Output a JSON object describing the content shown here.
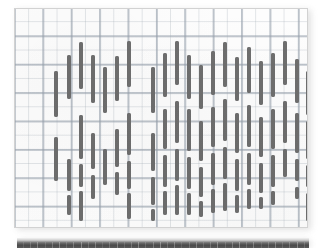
{
  "figure": {
    "kind": "scanned-graph-paper-figure",
    "panel": {
      "background_color": "#fdfdfd",
      "border_color": "#d2d2d2",
      "grid_minor_color": "#a0aab4",
      "grid_major_color": "#96a0ac",
      "grid_minor_spacing_px": 14.2,
      "grid_major_spacing_px": 28.4
    },
    "segment_color": "#6e6e6e",
    "segment_width_px": 3.4,
    "next_figure_strip": {
      "label": "cropped-top-edge-of-following-figure",
      "color_dark": "#4a4a4a",
      "color_light": "#f2f2f2"
    }
  },
  "chart_data": {
    "type": "bar",
    "title": "",
    "subtitle": "",
    "xlabel": "",
    "ylabel": "",
    "grid": true,
    "legend": null,
    "annotations": [],
    "xlim": [
      0,
      294
    ],
    "ylim": [
      0,
      220
    ],
    "note": "Vertical rounded bar segments plotted on graph paper; each column holds one or more stacked segments defined by top (y0) and bottom (y1) in panel pixel coordinates.",
    "columns": [
      {
        "x": 41,
        "segments": [
          {
            "y0": 62,
            "y1": 108
          },
          {
            "y0": 128,
            "y1": 172
          }
        ]
      },
      {
        "x": 54,
        "segments": [
          {
            "y0": 46,
            "y1": 90
          },
          {
            "y0": 150,
            "y1": 182
          },
          {
            "y0": 186,
            "y1": 206
          }
        ]
      },
      {
        "x": 66,
        "segments": [
          {
            "y0": 33,
            "y1": 80
          },
          {
            "y0": 106,
            "y1": 150
          },
          {
            "y0": 155,
            "y1": 178
          },
          {
            "y0": 182,
            "y1": 212
          }
        ]
      },
      {
        "x": 78,
        "segments": [
          {
            "y0": 46,
            "y1": 94
          },
          {
            "y0": 124,
            "y1": 160
          },
          {
            "y0": 166,
            "y1": 190
          }
        ]
      },
      {
        "x": 90,
        "segments": [
          {
            "y0": 58,
            "y1": 104
          },
          {
            "y0": 140,
            "y1": 176
          }
        ]
      },
      {
        "x": 102,
        "segments": [
          {
            "y0": 47,
            "y1": 92
          },
          {
            "y0": 120,
            "y1": 158
          },
          {
            "y0": 163,
            "y1": 186
          }
        ]
      },
      {
        "x": 114,
        "segments": [
          {
            "y0": 32,
            "y1": 78
          },
          {
            "y0": 104,
            "y1": 146
          },
          {
            "y0": 152,
            "y1": 180
          },
          {
            "y0": 184,
            "y1": 210
          }
        ]
      },
      {
        "x": 138,
        "segments": [
          {
            "y0": 58,
            "y1": 104
          },
          {
            "y0": 124,
            "y1": 162
          },
          {
            "y0": 168,
            "y1": 196
          },
          {
            "y0": 200,
            "y1": 212
          }
        ]
      },
      {
        "x": 150,
        "segments": [
          {
            "y0": 44,
            "y1": 88
          },
          {
            "y0": 100,
            "y1": 140
          },
          {
            "y0": 146,
            "y1": 178
          },
          {
            "y0": 182,
            "y1": 206
          }
        ]
      },
      {
        "x": 162,
        "segments": [
          {
            "y0": 32,
            "y1": 76
          },
          {
            "y0": 92,
            "y1": 134
          },
          {
            "y0": 140,
            "y1": 172
          },
          {
            "y0": 176,
            "y1": 206
          }
        ]
      },
      {
        "x": 174,
        "segments": [
          {
            "y0": 46,
            "y1": 90
          },
          {
            "y0": 100,
            "y1": 142
          },
          {
            "y0": 148,
            "y1": 180
          },
          {
            "y0": 184,
            "y1": 206
          }
        ]
      },
      {
        "x": 186,
        "segments": [
          {
            "y0": 56,
            "y1": 100
          },
          {
            "y0": 112,
            "y1": 152
          },
          {
            "y0": 158,
            "y1": 188
          },
          {
            "y0": 192,
            "y1": 208
          }
        ]
      },
      {
        "x": 198,
        "segments": [
          {
            "y0": 42,
            "y1": 86
          },
          {
            "y0": 98,
            "y1": 138
          },
          {
            "y0": 144,
            "y1": 176
          },
          {
            "y0": 180,
            "y1": 204
          }
        ]
      },
      {
        "x": 210,
        "segments": [
          {
            "y0": 33,
            "y1": 78
          },
          {
            "y0": 90,
            "y1": 132
          },
          {
            "y0": 138,
            "y1": 170
          },
          {
            "y0": 174,
            "y1": 202
          }
        ]
      },
      {
        "x": 222,
        "segments": [
          {
            "y0": 48,
            "y1": 92
          },
          {
            "y0": 104,
            "y1": 144
          },
          {
            "y0": 150,
            "y1": 182
          },
          {
            "y0": 186,
            "y1": 204
          }
        ]
      },
      {
        "x": 234,
        "segments": [
          {
            "y0": 38,
            "y1": 84
          },
          {
            "y0": 96,
            "y1": 138
          },
          {
            "y0": 144,
            "y1": 176
          },
          {
            "y0": 180,
            "y1": 200
          }
        ]
      },
      {
        "x": 246,
        "segments": [
          {
            "y0": 52,
            "y1": 96
          },
          {
            "y0": 108,
            "y1": 148
          },
          {
            "y0": 154,
            "y1": 184
          },
          {
            "y0": 188,
            "y1": 200
          }
        ]
      },
      {
        "x": 258,
        "segments": [
          {
            "y0": 44,
            "y1": 88
          },
          {
            "y0": 100,
            "y1": 140
          },
          {
            "y0": 146,
            "y1": 178
          },
          {
            "y0": 182,
            "y1": 196
          }
        ]
      },
      {
        "x": 270,
        "segments": [
          {
            "y0": 32,
            "y1": 76
          },
          {
            "y0": 92,
            "y1": 134
          },
          {
            "y0": 140,
            "y1": 168
          }
        ]
      },
      {
        "x": 282,
        "segments": [
          {
            "y0": 50,
            "y1": 94
          },
          {
            "y0": 104,
            "y1": 144
          },
          {
            "y0": 150,
            "y1": 172
          },
          {
            "y0": 178,
            "y1": 190
          }
        ]
      },
      {
        "x": 293,
        "segments": [
          {
            "y0": 62,
            "y1": 106
          },
          {
            "y0": 112,
            "y1": 150
          },
          {
            "y0": 156,
            "y1": 178
          },
          {
            "y0": 184,
            "y1": 212
          }
        ]
      }
    ]
  }
}
